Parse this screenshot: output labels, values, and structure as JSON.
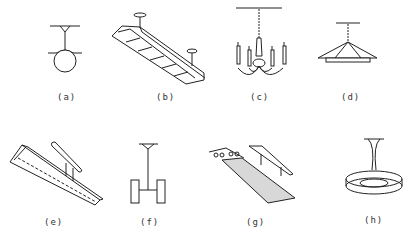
{
  "figure": {
    "type": "light fixture illustrations",
    "panels": [
      {
        "id": "a",
        "label": "(a)",
        "description": "pendant globe"
      },
      {
        "id": "b",
        "label": "(b)",
        "description": "suspended fluorescent luminaire with louvers"
      },
      {
        "id": "c",
        "label": "(c)",
        "description": "candle chandelier"
      },
      {
        "id": "d",
        "label": "(d)",
        "description": "pendant shade luminaire"
      },
      {
        "id": "e",
        "label": "(e)",
        "description": "fluorescent strip with louver"
      },
      {
        "id": "f",
        "label": "(f)",
        "description": "pendant with two cylinder lamps"
      },
      {
        "id": "g",
        "label": "(g)",
        "description": "fluorescent fixture with diffuser"
      },
      {
        "id": "h",
        "label": "(h)",
        "description": "pendant ring luminaire"
      }
    ]
  }
}
